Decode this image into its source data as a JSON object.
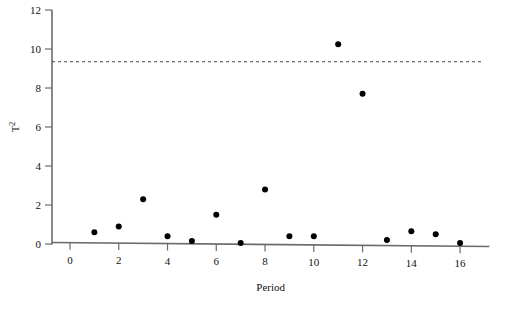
{
  "chart_data": {
    "type": "scatter",
    "title": "",
    "xlabel": "Period",
    "ylabel": "T²",
    "ylabel_base": "T",
    "ylabel_exp": "2",
    "x": [
      1,
      2,
      3,
      4,
      5,
      6,
      7,
      8,
      9,
      10,
      11,
      12,
      13,
      14,
      15,
      16
    ],
    "values": [
      0.6,
      0.9,
      2.3,
      0.4,
      0.15,
      1.5,
      0.05,
      2.8,
      0.4,
      0.4,
      10.25,
      7.7,
      0.2,
      0.65,
      0.5,
      0.05
    ],
    "series": [
      {
        "name": "T² statistic",
        "values": [
          0.6,
          0.9,
          2.3,
          0.4,
          0.15,
          1.5,
          0.05,
          2.8,
          0.4,
          0.4,
          10.25,
          7.7,
          0.2,
          0.65,
          0.5,
          0.05
        ]
      }
    ],
    "xlim": [
      -0.5,
      17.2
    ],
    "ylim": [
      0,
      12
    ],
    "xticks": [
      0,
      2,
      4,
      6,
      8,
      10,
      12,
      14,
      16
    ],
    "xtick_labels": [
      "0",
      "2",
      "4",
      "6",
      "8",
      "10",
      "12",
      "14",
      "16"
    ],
    "yticks": [
      0,
      2,
      4,
      6,
      8,
      10,
      12
    ],
    "ytick_labels": [
      "0",
      "2",
      "4",
      "6",
      "8",
      "10",
      "12"
    ],
    "grid": false,
    "legend": "none",
    "annotations": [
      {
        "name": "upper-control-limit",
        "type": "hline",
        "value": 9.35,
        "style": "dashed",
        "label": ""
      }
    ],
    "marker": {
      "shape": "circle",
      "size": 3,
      "color": "#000000"
    },
    "colors": {
      "axis": "#6b6b6b",
      "point": "#000000",
      "limit": "#444444",
      "text": "#111111",
      "background": "#ffffff"
    }
  }
}
